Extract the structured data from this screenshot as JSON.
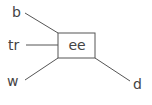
{
  "diagram": {
    "type": "graph",
    "center_node": {
      "id": "ee",
      "label": "ee",
      "shape": "rectangle"
    },
    "leaf_nodes": [
      {
        "id": "b",
        "label": "b",
        "position": "top-left"
      },
      {
        "id": "tr",
        "label": "tr",
        "position": "left"
      },
      {
        "id": "w",
        "label": "w",
        "position": "bottom-left"
      },
      {
        "id": "d",
        "label": "d",
        "position": "bottom-right"
      }
    ],
    "edges": [
      {
        "from": "b",
        "to": "ee"
      },
      {
        "from": "tr",
        "to": "ee"
      },
      {
        "from": "w",
        "to": "ee"
      },
      {
        "from": "ee",
        "to": "d"
      }
    ],
    "colors": {
      "line": "#555555",
      "text": "#444444",
      "background": "#ffffff"
    }
  }
}
